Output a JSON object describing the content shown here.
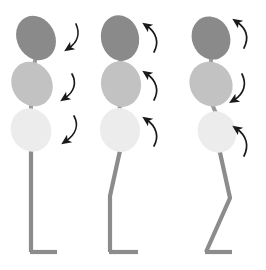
{
  "diagram": {
    "background_color": "#ffffff",
    "panel_count": 3,
    "colors": {
      "head_segment": "#8a8a8a",
      "thorax_segment": "#c2c2c2",
      "pelvis_segment": "#ececec",
      "spine_line": "#9a9a9a",
      "leg_line": "#8c8c8c",
      "arrow": "#1a1a1a"
    },
    "segment_names": [
      "head",
      "thorax",
      "pelvis"
    ],
    "figures": [
      {
        "name": "figure-1-neutral-stance",
        "label": "",
        "posture": "upright straight leg",
        "knee": "extended",
        "segments": [
          {
            "name": "head",
            "fill": "#8a8a8a",
            "cx": 36,
            "cy": 38,
            "rx": 19,
            "ry": 23,
            "rotation": -28
          },
          {
            "name": "thorax",
            "fill": "#c2c2c2",
            "cx": 32,
            "cy": 84,
            "rx": 20,
            "ry": 23,
            "rotation": -30
          },
          {
            "name": "pelvis",
            "fill": "#ececec",
            "cx": 31,
            "cy": 130,
            "rx": 20,
            "ry": 22,
            "rotation": -25
          }
        ],
        "arrows": [
          {
            "name": "head-rotation-arrow",
            "direction": "down",
            "x": 66,
            "y": 26
          },
          {
            "name": "thorax-rotation-arrow",
            "direction": "down",
            "x": 62,
            "y": 76
          },
          {
            "name": "pelvis-rotation-arrow",
            "direction": "down",
            "x": 64,
            "y": 118
          }
        ]
      },
      {
        "name": "figure-2-extension-stance",
        "label": "",
        "posture": "upright with posterior shank lean",
        "knee": "slightly flexed",
        "segments": [
          {
            "name": "head",
            "fill": "#8a8a8a",
            "cx": 32,
            "cy": 38,
            "rx": 19,
            "ry": 23,
            "rotation": -12
          },
          {
            "name": "thorax",
            "fill": "#c2c2c2",
            "cx": 33,
            "cy": 84,
            "rx": 20,
            "ry": 23,
            "rotation": -8
          },
          {
            "name": "pelvis",
            "fill": "#ececec",
            "cx": 32,
            "cy": 130,
            "rx": 20,
            "ry": 22,
            "rotation": -10
          }
        ],
        "arrows": [
          {
            "name": "head-rotation-arrow",
            "direction": "up",
            "x": 58,
            "y": 26
          },
          {
            "name": "thorax-rotation-arrow",
            "direction": "up",
            "x": 58,
            "y": 72
          },
          {
            "name": "pelvis-rotation-arrow",
            "direction": "up",
            "x": 58,
            "y": 118
          }
        ]
      },
      {
        "name": "figure-3-flexion-stance",
        "label": "",
        "posture": "forward tilt with flexed knee",
        "knee": "flexed",
        "segments": [
          {
            "name": "head",
            "fill": "#8a8a8a",
            "cx": 33,
            "cy": 38,
            "rx": 19,
            "ry": 22,
            "rotation": -22
          },
          {
            "name": "thorax",
            "fill": "#c2c2c2",
            "cx": 33,
            "cy": 84,
            "rx": 21,
            "ry": 23,
            "rotation": -34
          },
          {
            "name": "pelvis",
            "fill": "#ececec",
            "cx": 39,
            "cy": 132,
            "rx": 19,
            "ry": 21,
            "rotation": -26
          }
        ],
        "arrows": [
          {
            "name": "head-rotation-arrow",
            "direction": "up",
            "x": 58,
            "y": 22
          },
          {
            "name": "thorax-rotation-arrow",
            "direction": "down",
            "x": 58,
            "y": 76
          },
          {
            "name": "pelvis-rotation-arrow",
            "direction": "up",
            "x": 58,
            "y": 126
          }
        ]
      }
    ]
  }
}
